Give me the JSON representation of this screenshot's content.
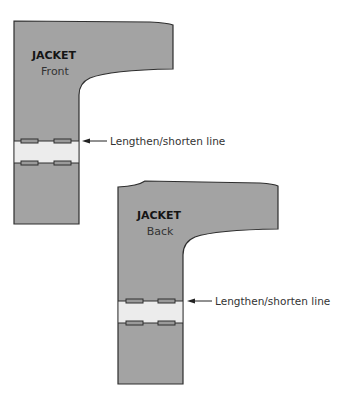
{
  "diagram": {
    "front_piece": {
      "title": "JACKET",
      "subtitle": "Front",
      "callout": "Lengthen/shorten line"
    },
    "back_piece": {
      "title": "JACKET",
      "subtitle": "Back",
      "callout": "Lengthen/shorten line"
    },
    "colors": {
      "piece_fill": "#a3a3a3",
      "band_fill": "#ececec",
      "outline": "#2e2e2e"
    }
  }
}
